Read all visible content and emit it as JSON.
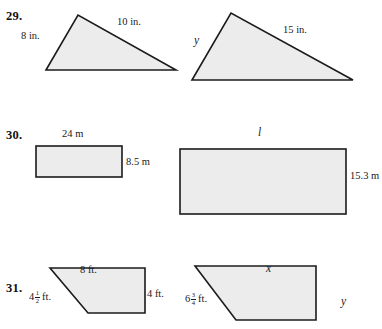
{
  "page": {
    "kind": "math-exercise-figures",
    "background_color": "#ffffff",
    "shape_fill_color": "#ececec",
    "shape_stroke_color": "#1b1b1b"
  },
  "problems": [
    {
      "number": "29.",
      "figure_type": "triangle-pair",
      "labels": {
        "small_left": "8 in.",
        "small_top_right": "10 in.",
        "large_left": "y",
        "large_top_right": "15 in."
      }
    },
    {
      "number": "30.",
      "figure_type": "rectangle-pair",
      "labels": {
        "small_top": "24 m",
        "small_right": "8.5 m",
        "large_top": "l",
        "large_right": "15.3 m"
      }
    },
    {
      "number": "31.",
      "figure_type": "trapezoid-pair",
      "labels": {
        "small_top": "8 ft.",
        "small_left_whole": "4",
        "small_left_num": "1",
        "small_left_den": "2",
        "small_left_unit": "ft.",
        "small_right": "4 ft.",
        "large_top": "x",
        "large_left_whole": "6",
        "large_left_num": "3",
        "large_left_den": "4",
        "large_left_unit": "ft.",
        "large_right": "y"
      }
    }
  ]
}
